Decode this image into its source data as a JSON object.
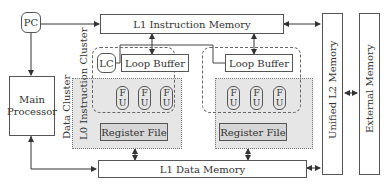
{
  "diagram": {
    "pc": {
      "label": "PC"
    },
    "main_processor": {
      "line1": "Main",
      "line2": "Processor"
    },
    "l1_instruction_memory": {
      "label": "L1 Instruction Memory"
    },
    "l1_data_memory": {
      "label": "L1 Data Memory"
    },
    "unified_l2_memory": {
      "label": "Unified L2 Memory"
    },
    "external_memory": {
      "label": "External Memory"
    },
    "data_cluster_label": "Data Cluster",
    "l0_instruction_cluster_label": "L0 Instruction Cluster",
    "clusters": [
      {
        "lc": "LC",
        "loop_buffer": "Loop Buffer",
        "functional_units": [
          {
            "top": "F",
            "bottom": "U"
          },
          {
            "top": "F",
            "bottom": "U"
          },
          {
            "top": "F",
            "bottom": "U"
          }
        ],
        "register_file": "Register File"
      },
      {
        "loop_buffer": "Loop Buffer",
        "functional_units": [
          {
            "top": "F",
            "bottom": "U"
          },
          {
            "top": "F",
            "bottom": "U"
          },
          {
            "top": "F",
            "bottom": "U"
          }
        ],
        "register_file": "Register File"
      }
    ],
    "colors": {
      "stroke": "#555555",
      "cluster_fill": "#e6e6e6",
      "register_fill": "#d6d6d6",
      "background": "#ffffff"
    }
  }
}
